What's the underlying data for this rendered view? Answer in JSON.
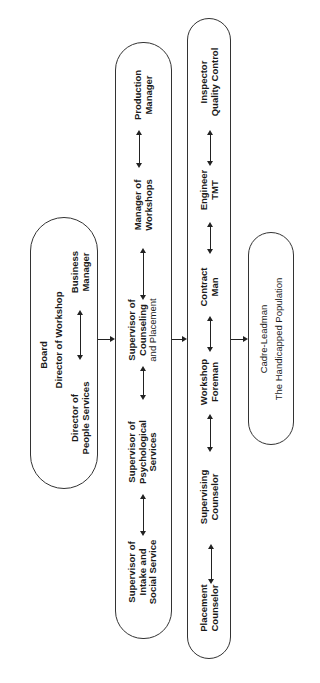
{
  "diagram": {
    "orientation": "rotated 90 degrees counter-clockwise",
    "nodes": {
      "board": {
        "title": "Board",
        "subtitle": "Director of Workshop",
        "left": "Director of",
        "left2": "People Services",
        "right": "Business",
        "right2": "Manager"
      },
      "supervisors": {
        "items": [
          {
            "line1": "Supervisor of",
            "line2": "Intake and",
            "line3": "Social Service"
          },
          {
            "line1": "Supervisor of",
            "line2": "Psychological",
            "line3": "Services"
          },
          {
            "line1": "Supervisor of",
            "line2": "Counseling",
            "line3": "and Placement"
          },
          {
            "line1": "Manager of",
            "line2": "Workshops"
          },
          {
            "line1": "Production",
            "line2": "Manager"
          }
        ]
      },
      "staff": {
        "items": [
          {
            "line1": "Placement",
            "line2": "Counselor"
          },
          {
            "line1": "Supervising",
            "line2": "Counselor"
          },
          {
            "line1": "Workshop",
            "line2": "Foreman"
          },
          {
            "line1": "Contract",
            "line2": "Man"
          },
          {
            "line1": "Engineer",
            "line2": "TMT"
          },
          {
            "line1": "Inspector",
            "line2": "Quality Control"
          }
        ]
      },
      "population": {
        "line1": "Cadre-Leadman",
        "line2": "The Handicapped Population"
      }
    },
    "colors": {
      "line": "#222222",
      "background": "#ffffff"
    }
  }
}
